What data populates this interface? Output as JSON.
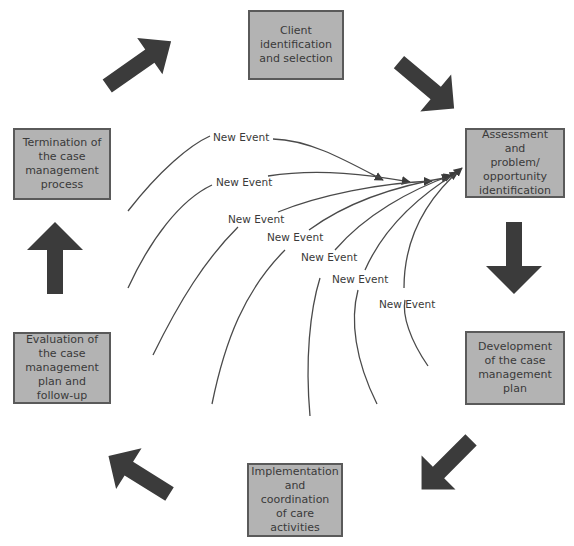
{
  "diagram": {
    "stages": [
      {
        "id": "client-identification",
        "label": "Client\nidentification\nand selection"
      },
      {
        "id": "assessment",
        "label": "Assessment and\nproblem/\nopportunity\nidentification"
      },
      {
        "id": "development",
        "label": "Development\nof the case\nmanagement\nplan"
      },
      {
        "id": "implementation",
        "label": "Implementation\nand coordination\nof care activities"
      },
      {
        "id": "evaluation",
        "label": "Evaluation of\nthe case\nmanagement\nplan and\nfollow-up"
      },
      {
        "id": "termination",
        "label": "Termination of\nthe case\nmanagement\nprocess"
      }
    ],
    "flow_arrows": [
      {
        "from": "client-identification",
        "to": "assessment",
        "direction": "down-right"
      },
      {
        "from": "assessment",
        "to": "development",
        "direction": "down"
      },
      {
        "from": "development",
        "to": "implementation",
        "direction": "down-left"
      },
      {
        "from": "implementation",
        "to": "evaluation",
        "direction": "up-left"
      },
      {
        "from": "evaluation",
        "to": "termination",
        "direction": "up"
      },
      {
        "from": "termination",
        "to": "client-identification",
        "direction": "up-right"
      }
    ],
    "events": [
      {
        "label": "New Event",
        "target": "assessment"
      },
      {
        "label": "New Event",
        "target": "assessment"
      },
      {
        "label": "New Event",
        "target": "assessment"
      },
      {
        "label": "New Event",
        "target": "assessment"
      },
      {
        "label": "New Event",
        "target": "assessment"
      },
      {
        "label": "New Event",
        "target": "assessment"
      },
      {
        "label": "New Event",
        "target": "assessment"
      }
    ],
    "colors": {
      "box_fill": "#b3b3b3",
      "box_border": "#5a5a5a",
      "arrow": "#3b3b3b",
      "curve": "#4a4a4a",
      "text": "#3a3a3a"
    }
  }
}
